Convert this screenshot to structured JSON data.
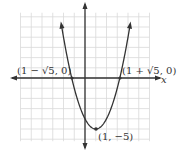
{
  "chart_data": {
    "type": "line",
    "title": "",
    "xlabel": "x",
    "ylabel": "y",
    "function": "y = (x - 1)^2 - 5",
    "grid": true,
    "xlim": [
      -6,
      6
    ],
    "ylim": [
      -6,
      6
    ],
    "series": [
      {
        "name": "parabola",
        "x": [
          -2.2,
          -1.5,
          -1.236,
          -1,
          0,
          1,
          2,
          3,
          3.236,
          3.5,
          4.2
        ],
        "y": [
          5.24,
          1.25,
          0,
          -0.0,
          -4,
          -5,
          -4,
          -1,
          0,
          1.25,
          5.24
        ]
      }
    ],
    "annotations": [
      {
        "label": "(1 − √5, 0)",
        "x": -1.236,
        "y": 0
      },
      {
        "label": "(1 + √5, 0)",
        "x": 3.236,
        "y": 0
      },
      {
        "label": "(1, −5)",
        "x": 1,
        "y": -5
      }
    ]
  },
  "labels": {
    "left_intercept": "(1 − √5, 0)",
    "right_intercept": "(1 + √5, 0)",
    "vertex": "(1, −5)",
    "x_axis": "x",
    "y_axis": "y"
  },
  "colors": {
    "curve": "#333333",
    "axis": "#333333",
    "grid": "#d9d9d9"
  }
}
